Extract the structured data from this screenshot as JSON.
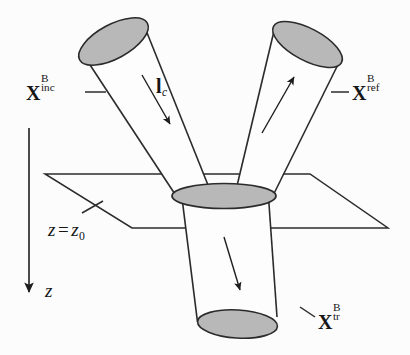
{
  "figure": {
    "background_color": "#fcfcfc",
    "stroke_color": "#2b2b2b",
    "cap_fill_color": "#b8b8b8",
    "cylinder_fill_color": "#fdfdfd"
  },
  "labels": {
    "incident": {
      "base": "X",
      "superscript": "B",
      "subscript": "inc",
      "full": "X_inc^B"
    },
    "reflected": {
      "base": "X",
      "superscript": "B",
      "subscript": "ref",
      "full": "X_ref^B"
    },
    "transmitted": {
      "base": "X",
      "superscript": "B",
      "subscript": "tr",
      "full": "X_tr^B"
    },
    "coherence_length": {
      "base": "l",
      "subscript": "c",
      "full": "l_c"
    },
    "plane": {
      "variable": "z",
      "equals": "=",
      "value_base": "z",
      "value_subscript": "0",
      "full": "z = z0"
    },
    "axis": {
      "name": "z"
    }
  }
}
